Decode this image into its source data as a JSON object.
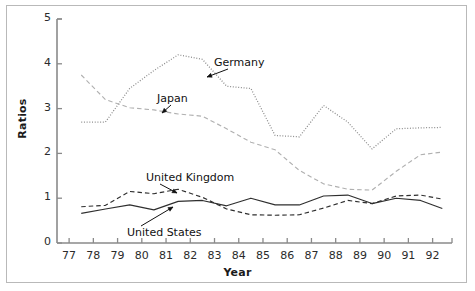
{
  "chart_data": {
    "type": "line",
    "title": "",
    "xlabel": "Year",
    "ylabel": "Ratios",
    "xlim": [
      76.5,
      92.8
    ],
    "ylim": [
      0,
      5
    ],
    "xticks": [
      "77",
      "78",
      "79",
      "80",
      "81",
      "82",
      "83",
      "84",
      "85",
      "86",
      "87",
      "88",
      "89",
      "90",
      "91",
      "92"
    ],
    "yticks": [
      "0",
      "1",
      "2",
      "3",
      "4",
      "5"
    ],
    "grid": false,
    "legend_position": "inline-annotations",
    "x": [
      77.5,
      78.5,
      79.5,
      80.5,
      81.5,
      82.5,
      83.5,
      84.5,
      85.5,
      86.5,
      87.5,
      88.5,
      89.5,
      90.5,
      91.5,
      92.4
    ],
    "series": [
      {
        "name": "Germany",
        "style": "dotted",
        "color": "#8c8c8c",
        "values": [
          2.7,
          2.7,
          3.45,
          3.85,
          4.2,
          4.1,
          3.5,
          3.45,
          2.4,
          2.37,
          3.07,
          2.7,
          2.1,
          2.55,
          2.57,
          2.58
        ]
      },
      {
        "name": "Japan",
        "style": "dashed",
        "color": "#b0b0b0",
        "values": [
          3.75,
          3.2,
          3.02,
          2.97,
          2.88,
          2.83,
          2.55,
          2.25,
          2.08,
          1.62,
          1.32,
          1.2,
          1.18,
          1.6,
          1.97,
          2.03
        ]
      },
      {
        "name": "United Kingdom",
        "style": "dashed",
        "color": "#2f2f2f",
        "values": [
          0.81,
          0.84,
          1.15,
          1.1,
          1.2,
          1.02,
          0.76,
          0.63,
          0.62,
          0.63,
          0.78,
          0.95,
          0.88,
          1.05,
          1.07,
          0.98
        ]
      },
      {
        "name": "United States",
        "style": "solid",
        "color": "#2f2f2f",
        "values": [
          0.66,
          0.76,
          0.85,
          0.74,
          0.93,
          0.95,
          0.83,
          1.0,
          0.85,
          0.85,
          1.05,
          1.07,
          0.88,
          1.0,
          0.95,
          0.77
        ]
      }
    ],
    "annotations": [
      {
        "label": "Germany",
        "lx": 214,
        "ly": 56,
        "ax": 207,
        "ay": 77
      },
      {
        "label": "Japan",
        "lx": 157,
        "ly": 92,
        "ax": 162,
        "ay": 113
      },
      {
        "label": "United Kingdom",
        "lx": 146,
        "ly": 171,
        "ax": 177,
        "ay": 193
      },
      {
        "label": "United States",
        "lx": 127,
        "ly": 226,
        "ax": 173,
        "ay": 207
      }
    ]
  },
  "axis": {
    "ylabel": "Ratios",
    "xlabel": "Year"
  }
}
